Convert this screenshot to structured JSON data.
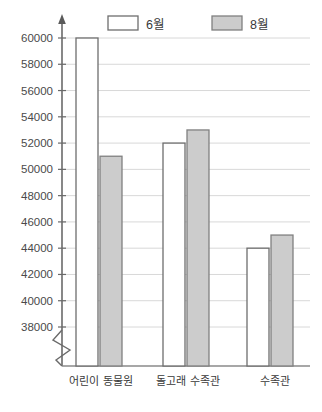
{
  "chart_data": {
    "type": "bar",
    "title": "",
    "xlabel": "",
    "ylabel": "",
    "categories": [
      "어린이 동물원",
      "돌고래 수족관",
      "수족관"
    ],
    "series": [
      {
        "name": "6월",
        "values": [
          60000,
          52000,
          44000
        ],
        "fill": "#ffffff",
        "stroke": "#6e6e6e"
      },
      {
        "name": "8월",
        "values": [
          51000,
          53000,
          45000
        ],
        "fill": "#cccccc",
        "stroke": "#808080"
      }
    ],
    "ylim": [
      38000,
      60000
    ],
    "yticks": [
      38000,
      40000,
      42000,
      44000,
      46000,
      48000,
      50000,
      52000,
      54000,
      56000,
      58000,
      60000
    ],
    "ytick_labels": [
      "38000",
      "40000",
      "42000",
      "44000",
      "46000",
      "48000",
      "50000",
      "52000",
      "54000",
      "56000",
      "58000",
      "60000"
    ],
    "grid": true,
    "axis_break": true,
    "axis_arrow": true,
    "legend_position": "top"
  },
  "legend": {
    "entries": [
      {
        "label": "6월",
        "swatch_fill": "#ffffff",
        "swatch_stroke": "#6e6e6e"
      },
      {
        "label": "8월",
        "swatch_fill": "#cccccc",
        "swatch_stroke": "#808080"
      }
    ]
  },
  "axis": {
    "tick_labels": [
      "60000",
      "58000",
      "56000",
      "54000",
      "52000",
      "50000",
      "48000",
      "46000",
      "44000",
      "42000",
      "40000",
      "38000"
    ],
    "category_labels": [
      "어린이 동물원",
      "돌고래 수족관",
      "수족관"
    ]
  },
  "colors": {
    "grid": "#d8d8d8",
    "axis": "#6a6a6a",
    "bar_white_fill": "#ffffff",
    "bar_white_stroke": "#6e6e6e",
    "bar_gray_fill": "#cccccc",
    "bar_gray_stroke": "#808080",
    "text": "#3a3a3a",
    "background": "#ffffff"
  }
}
